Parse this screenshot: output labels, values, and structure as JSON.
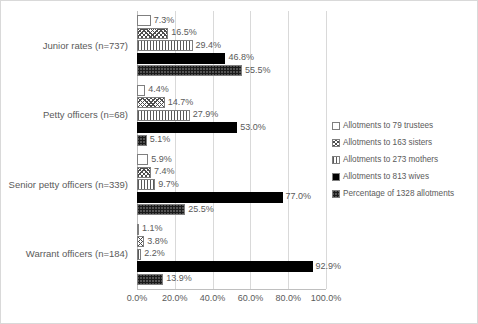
{
  "chart_data": {
    "type": "bar",
    "orientation": "horizontal",
    "title": "",
    "xlabel": "",
    "ylabel": "",
    "xlim": [
      0,
      100
    ],
    "grid": true,
    "legend_position": "right",
    "xticks": [
      "0.0%",
      "20.0%",
      "40.0%",
      "60.0%",
      "80.0%",
      "100.0%"
    ],
    "xtick_values": [
      0,
      20,
      40,
      60,
      80,
      100
    ],
    "categories": [
      "Junior rates (n=737)",
      "Petty officers (n=68)",
      "Senior petty officers (n=339)",
      "Warrant officers (n=184)"
    ],
    "series": [
      {
        "name": "Allotments to 79 trustees",
        "pattern": "sparse-dots",
        "values": [
          7.3,
          4.4,
          5.9,
          1.1
        ],
        "labels": [
          "7.3%",
          "4.4%",
          "5.9%",
          "1.1%"
        ]
      },
      {
        "name": "Allotments to 163 sisters",
        "pattern": "cross-hatch",
        "values": [
          16.5,
          14.7,
          7.4,
          3.8
        ],
        "labels": [
          "16.5%",
          "14.7%",
          "7.4%",
          "3.8%"
        ]
      },
      {
        "name": "Allotments to 273 mothers",
        "pattern": "vertical-lines",
        "values": [
          29.4,
          27.9,
          9.7,
          2.2
        ],
        "labels": [
          "29.4%",
          "27.9%",
          "9.7%",
          "2.2%"
        ]
      },
      {
        "name": "Allotments to 813 wives",
        "pattern": "solid-black",
        "values": [
          46.8,
          53.0,
          77.0,
          92.9
        ],
        "labels": [
          "46.8%",
          "53.0%",
          "77.0%",
          "92.9%"
        ]
      },
      {
        "name": "Percentage of 1328 allotments",
        "pattern": "dense-dots",
        "values": [
          55.5,
          5.1,
          25.5,
          13.9
        ],
        "labels": [
          "55.5%",
          "5.1%",
          "25.5%",
          "13.9%"
        ]
      }
    ]
  },
  "colors": {
    "text": "#5a5a5a",
    "gridline": "#d9d9d9",
    "axis": "#bfbfbf",
    "border": "#d9d9d9",
    "solid_series": "#000000",
    "background": "#ffffff"
  }
}
